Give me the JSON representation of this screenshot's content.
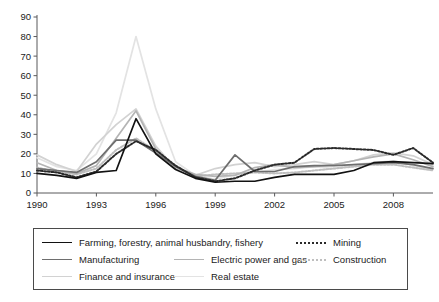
{
  "chart_data": {
    "type": "line",
    "title": "",
    "xlabel": "",
    "ylabel": "",
    "xlim": [
      1990,
      2010
    ],
    "ylim": [
      0,
      90
    ],
    "grid": false,
    "legend_position": "bottom",
    "x": [
      1990,
      1991,
      1992,
      1993,
      1994,
      1995,
      1996,
      1997,
      1998,
      1999,
      2000,
      2001,
      2002,
      2003,
      2004,
      2005,
      2006,
      2007,
      2008,
      2009,
      2010
    ],
    "xticks": [
      "1990",
      "1993",
      "1996",
      "1999",
      "2002",
      "2005",
      "2008"
    ],
    "xtick_values": [
      1990,
      1993,
      1996,
      1999,
      2002,
      2005,
      2008
    ],
    "yticks": [
      "0",
      "10",
      "20",
      "30",
      "40",
      "50",
      "60",
      "70",
      "80",
      "90"
    ],
    "ytick_values": [
      0,
      10,
      20,
      30,
      40,
      50,
      60,
      70,
      80,
      90
    ],
    "series": [
      {
        "name": "Farming, forestry, animal husbandry, fishery",
        "color": "#121212",
        "style": "solid",
        "width": 1.7,
        "values": [
          10.0,
          9.0,
          7.5,
          10.5,
          11.5,
          38.0,
          20.0,
          12.0,
          7.5,
          5.5,
          6.0,
          6.0,
          8.0,
          9.5,
          9.5,
          9.5,
          11.5,
          15.5,
          16.0,
          15.5,
          15.0
        ]
      },
      {
        "name": "Mining",
        "color": "#2a2a2a",
        "style": "dotted",
        "width": 2.0,
        "values": [
          11.5,
          10.5,
          8.0,
          11.0,
          20.0,
          26.5,
          22.0,
          14.0,
          8.0,
          6.0,
          7.5,
          11.5,
          14.5,
          15.5,
          22.5,
          23.0,
          22.5,
          22.0,
          19.5,
          23.0,
          15.5
        ]
      },
      {
        "name": "Manufacturing",
        "color": "#6e6e6e",
        "style": "solid",
        "width": 1.7,
        "values": [
          12.5,
          11.5,
          10.5,
          16.0,
          27.0,
          27.0,
          20.5,
          13.5,
          8.5,
          6.5,
          19.5,
          11.0,
          11.0,
          13.5,
          14.0,
          14.0,
          14.5,
          15.0,
          15.5,
          14.5,
          12.5
        ]
      },
      {
        "name": "Electric power and gas",
        "color": "#b4b4b4",
        "style": "solid",
        "width": 1.7,
        "values": [
          15.5,
          11.5,
          10.0,
          14.0,
          28.0,
          42.0,
          22.5,
          13.0,
          9.5,
          8.5,
          9.0,
          13.0,
          14.5,
          13.0,
          13.5,
          14.5,
          16.5,
          18.5,
          20.0,
          17.0,
          13.5
        ]
      },
      {
        "name": "Construction",
        "color": "#bfbfbf",
        "style": "dotted",
        "width": 2.0,
        "values": [
          13.0,
          11.0,
          9.5,
          12.5,
          22.0,
          28.0,
          21.5,
          13.5,
          8.5,
          9.5,
          10.0,
          10.5,
          10.0,
          10.5,
          11.5,
          12.5,
          13.5,
          14.5,
          14.5,
          13.0,
          11.5
        ]
      },
      {
        "name": "Finance and insurance",
        "color": "#d2d2d2",
        "style": "solid",
        "width": 1.7,
        "values": [
          19.5,
          14.5,
          11.0,
          25.0,
          35.0,
          43.0,
          24.0,
          12.5,
          9.0,
          12.5,
          14.5,
          15.5,
          13.5,
          14.5,
          16.0,
          14.5,
          16.5,
          19.5,
          20.5,
          19.0,
          14.5
        ]
      },
      {
        "name": "Real estate",
        "color": "#e3e3e3",
        "style": "solid",
        "width": 1.7,
        "values": [
          18.0,
          13.5,
          11.5,
          20.0,
          41.0,
          80.0,
          43.0,
          16.0,
          9.0,
          7.0,
          9.5,
          10.5,
          12.0,
          12.5,
          13.5,
          12.5,
          14.5,
          15.5,
          16.5,
          14.0,
          12.0
        ]
      }
    ]
  },
  "legend": {
    "rows": [
      [
        {
          "label": "Farming, forestry, animal husbandry, fishery",
          "color": "#121212",
          "style": "solid",
          "left": 8,
          "swatch": 30
        },
        {
          "label": "Mining",
          "color": "#2a2a2a",
          "style": "dotted",
          "left": 262,
          "swatch": 30
        }
      ],
      [
        {
          "label": "Manufacturing",
          "color": "#6e6e6e",
          "style": "solid",
          "left": 8,
          "swatch": 30
        },
        {
          "label": "Electric power and gas",
          "color": "#b4b4b4",
          "style": "solid",
          "left": 140,
          "swatch": 30
        },
        {
          "label": "Construction",
          "color": "#bfbfbf",
          "style": "dotted",
          "left": 262,
          "swatch": 30
        }
      ],
      [
        {
          "label": "Finance and insurance",
          "color": "#d2d2d2",
          "style": "solid",
          "left": 8,
          "swatch": 30
        },
        {
          "label": "Real estate",
          "color": "#e3e3e3",
          "style": "solid",
          "left": 140,
          "swatch": 30
        }
      ]
    ]
  }
}
